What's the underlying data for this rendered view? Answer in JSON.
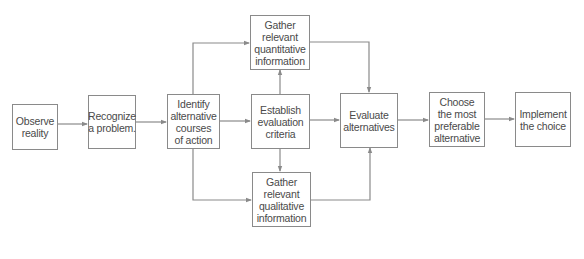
{
  "diagram": {
    "type": "flowchart",
    "colors": {
      "line": "#8a8a8a",
      "text": "#4a4a4a",
      "border": "#8a8a8a"
    },
    "nodes": {
      "observe": {
        "label": "Observe\nreality"
      },
      "recognize": {
        "label": "Recognize\na problem."
      },
      "identify": {
        "label": "Identify\nalternative\ncourses\nof action"
      },
      "quantitative": {
        "label": "Gather\nrelevant\nquantitative\ninformation"
      },
      "establish": {
        "label": "Establish\nevaluation\ncriteria"
      },
      "qualitative": {
        "label": "Gather\nrelevant\nqualitative\ninformation"
      },
      "evaluate": {
        "label": "Evaluate\nalternatives"
      },
      "choose": {
        "label": "Choose\nthe most\npreferable\nalternative"
      },
      "implement": {
        "label": "Implement\nthe choice"
      }
    },
    "edges": [
      {
        "from": "observe",
        "to": "recognize"
      },
      {
        "from": "recognize",
        "to": "identify"
      },
      {
        "from": "identify",
        "to": "quantitative"
      },
      {
        "from": "identify",
        "to": "establish"
      },
      {
        "from": "identify",
        "to": "qualitative"
      },
      {
        "from": "establish",
        "to": "quantitative"
      },
      {
        "from": "establish",
        "to": "qualitative"
      },
      {
        "from": "establish",
        "to": "evaluate"
      },
      {
        "from": "quantitative",
        "to": "evaluate"
      },
      {
        "from": "qualitative",
        "to": "evaluate"
      },
      {
        "from": "evaluate",
        "to": "choose"
      },
      {
        "from": "choose",
        "to": "implement"
      }
    ]
  }
}
